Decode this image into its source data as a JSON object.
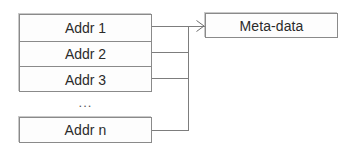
{
  "diagram": {
    "colors": {
      "background": "#ffffff",
      "box_fill": "#fdfdfd",
      "border": "#8a8a8a",
      "line": "#7d7d7d",
      "text": "#2b2b2b",
      "shadow": "#c9c9c9"
    },
    "address_table": {
      "rows": [
        {
          "label": "Addr 1"
        },
        {
          "label": "Addr 2"
        },
        {
          "label": "Addr 3"
        }
      ],
      "ellipsis": "...",
      "last_row": {
        "label": "Addr n"
      }
    },
    "target": {
      "label": "Meta-data"
    },
    "connectors": {
      "arrow_name": "arrowhead-icon"
    }
  }
}
